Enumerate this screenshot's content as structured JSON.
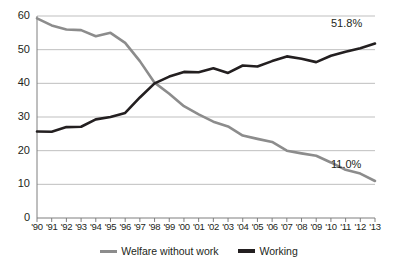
{
  "chart_data": {
    "type": "line",
    "title": "",
    "subtitle": "",
    "xlabel": "",
    "ylabel": "",
    "xlim": [
      0,
      23
    ],
    "ylim": [
      0,
      60
    ],
    "yticks": [
      0,
      10,
      20,
      30,
      40,
      50,
      60
    ],
    "grid": true,
    "grid_axis": "y",
    "legend_position": "bottom-center",
    "categories": [
      "'90",
      "'91",
      "'92",
      "'93",
      "'94",
      "'95",
      "'96",
      "'97",
      "'98",
      "'99",
      "'00",
      "'01",
      "'02",
      "'03",
      "'04",
      "'05",
      "'06",
      "'07",
      "'08",
      "'09",
      "'10",
      "'11",
      "'12",
      "'13"
    ],
    "series": [
      {
        "name": "Welfare without work",
        "color": "#8c8c8c",
        "values": [
          59.3,
          57.2,
          56.0,
          55.8,
          54.0,
          55.0,
          52.0,
          46.6,
          40.2,
          36.9,
          33.2,
          30.8,
          28.6,
          27.2,
          24.5,
          23.5,
          22.6,
          20.0,
          19.2,
          18.5,
          16.5,
          14.3,
          13.2,
          11.0
        ]
      },
      {
        "name": "Working",
        "color": "#231f20",
        "values": [
          25.7,
          25.6,
          27.0,
          27.1,
          29.3,
          30.0,
          31.2,
          35.8,
          40.0,
          42.0,
          43.4,
          43.3,
          44.5,
          43.1,
          45.3,
          45.0,
          46.6,
          48.0,
          47.3,
          46.3,
          48.2,
          49.4,
          50.4,
          51.8
        ]
      }
    ],
    "annotations": [
      {
        "name": "working-end-label",
        "text": "51.8%",
        "series": "Working",
        "x": "'13",
        "value": 51.8
      },
      {
        "name": "welfare-end-label",
        "text": "11.0%",
        "series": "Welfare without work",
        "x": "'13",
        "value": 11.0
      }
    ]
  },
  "legend": {
    "items": [
      {
        "label": "Welfare without work",
        "color": "#8c8c8c"
      },
      {
        "label": "Working",
        "color": "#231f20"
      }
    ]
  }
}
